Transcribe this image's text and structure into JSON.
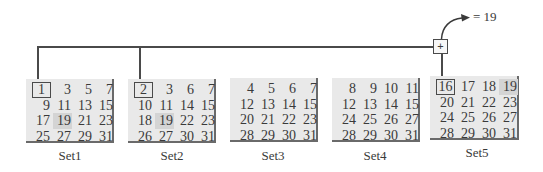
{
  "diagram": {
    "result_text": "= 19",
    "operator": "+",
    "sets": [
      {
        "label": "Set1",
        "cells": [
          "1",
          "3",
          "5",
          "7",
          "9",
          "11",
          "13",
          "15",
          "17",
          "19",
          "21",
          "23",
          "25",
          "27",
          "29",
          "31"
        ],
        "boxed_index": 0,
        "highlight_index": 9
      },
      {
        "label": "Set2",
        "cells": [
          "2",
          "3",
          "6",
          "7",
          "10",
          "11",
          "14",
          "15",
          "18",
          "19",
          "22",
          "23",
          "26",
          "27",
          "30",
          "31"
        ],
        "boxed_index": 0,
        "highlight_index": 9
      },
      {
        "label": "Set3",
        "cells": [
          "4",
          "5",
          "6",
          "7",
          "12",
          "13",
          "14",
          "15",
          "20",
          "21",
          "22",
          "23",
          "28",
          "29",
          "30",
          "31"
        ],
        "boxed_index": -1,
        "highlight_index": -1
      },
      {
        "label": "Set4",
        "cells": [
          "8",
          "9",
          "10",
          "11",
          "12",
          "13",
          "14",
          "15",
          "24",
          "25",
          "26",
          "27",
          "28",
          "29",
          "30",
          "31"
        ],
        "boxed_index": -1,
        "highlight_index": -1
      },
      {
        "label": "Set5",
        "cells": [
          "16",
          "17",
          "18",
          "19",
          "20",
          "21",
          "22",
          "23",
          "24",
          "25",
          "26",
          "27",
          "28",
          "29",
          "30",
          "31"
        ],
        "boxed_index": 0,
        "highlight_index": 3
      }
    ],
    "colors": {
      "box_bg": "#e9e9e9",
      "highlight_bg": "#d4d4d4",
      "line": "#4a4a4a"
    }
  }
}
